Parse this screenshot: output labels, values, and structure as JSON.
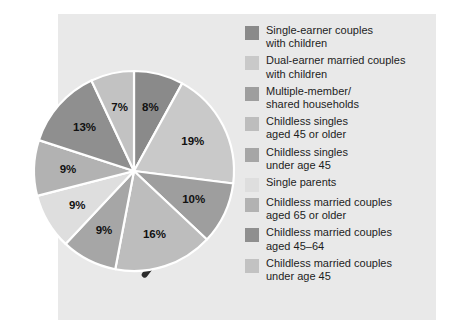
{
  "chart_data": {
    "type": "pie",
    "title": "",
    "subtitle": "",
    "xlabel": "",
    "ylabel": "",
    "legend_position": "right",
    "grid": false,
    "units": "percent",
    "total": 100,
    "start_angle_deg": 0,
    "direction": "clockwise",
    "categories": [
      "Single-earner couples\nwith children",
      "Dual-earner married couples\nwith children",
      "Multiple-member/\nshared households",
      "Childless singles\naged 45 or older",
      "Childless singles\nunder age 45",
      "Single parents",
      "Childless married couples\naged 65 or older",
      "Childless married couples\naged 45–64",
      "Childless married couples\nunder age 45"
    ],
    "values": [
      8,
      19,
      10,
      16,
      9,
      9,
      9,
      13,
      7
    ],
    "value_labels": [
      "8%",
      "19%",
      "10%",
      "16%",
      "9%",
      "9%",
      "9%",
      "13%",
      "7%"
    ],
    "colors": [
      "#8a8a8a",
      "#c9c9c9",
      "#9e9e9e",
      "#bdbdbd",
      "#a6a6a6",
      "#dedede",
      "#b2b2b2",
      "#8f8f8f",
      "#c2c2c2"
    ],
    "slice_separator_color": "#ffffff",
    "shadow_color": "#2b2b2b",
    "panel_color": "#e9e9e9",
    "background_color": "#ffffff",
    "label_text_color": "#111111"
  },
  "legend": {
    "items": [
      {
        "label": "Single-earner couples\nwith children",
        "color": "#8a8a8a",
        "value_label": "8%"
      },
      {
        "label": "Dual-earner married couples\nwith children",
        "color": "#c9c9c9",
        "value_label": "19%"
      },
      {
        "label": "Multiple-member/\nshared households",
        "color": "#9e9e9e",
        "value_label": "10%"
      },
      {
        "label": "Childless singles\naged 45 or older",
        "color": "#bdbdbd",
        "value_label": "16%"
      },
      {
        "label": "Childless singles\nunder age 45",
        "color": "#a6a6a6",
        "value_label": "9%"
      },
      {
        "label": "Single parents",
        "color": "#dedede",
        "value_label": "9%"
      },
      {
        "label": "Childless married couples\naged 65 or older",
        "color": "#b2b2b2",
        "value_label": "9%"
      },
      {
        "label": "Childless married couples\naged 45–64",
        "color": "#8f8f8f",
        "value_label": "13%"
      },
      {
        "label": "Childless married couples\nunder age 45",
        "color": "#c2c2c2",
        "value_label": "7%"
      }
    ]
  }
}
